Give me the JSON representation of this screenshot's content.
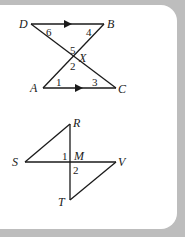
{
  "figure1": {
    "points": {
      "D": "D",
      "B": "B",
      "X": "X",
      "A": "A",
      "C": "C"
    },
    "angles": {
      "a1": "1",
      "a2": "2",
      "a3": "3",
      "a4": "4",
      "a5": "5",
      "a6": "6"
    }
  },
  "figure2": {
    "points": {
      "R": "R",
      "S": "S",
      "M": "M",
      "V": "V",
      "T": "T"
    },
    "angles": {
      "a1": "1",
      "a2": "2"
    }
  },
  "colors": {
    "frame": "#bdbdbd",
    "ink": "#1a1a1a",
    "background": "#ffffff"
  }
}
